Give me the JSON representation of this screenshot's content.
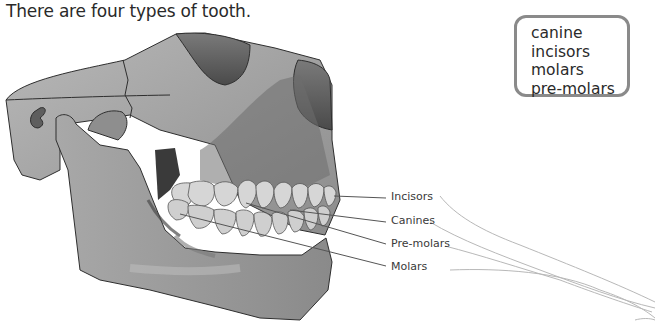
{
  "intro": {
    "text": "There are four types of tooth."
  },
  "word_box": {
    "words": [
      "canine",
      "incisors",
      "molars",
      "pre-molars"
    ]
  },
  "diagram": {
    "labels": [
      {
        "id": "incisors",
        "text": "Incisors"
      },
      {
        "id": "canines",
        "text": "Canines"
      },
      {
        "id": "pre-molars",
        "text": "Pre-molars"
      },
      {
        "id": "molars",
        "text": "Molars"
      }
    ],
    "colors": {
      "bone": "#9a9a9a",
      "bone_dark": "#5e5e5e",
      "teeth": "#d6d6d6",
      "outline": "#2e2e2e",
      "leader_line": "#555555"
    }
  }
}
